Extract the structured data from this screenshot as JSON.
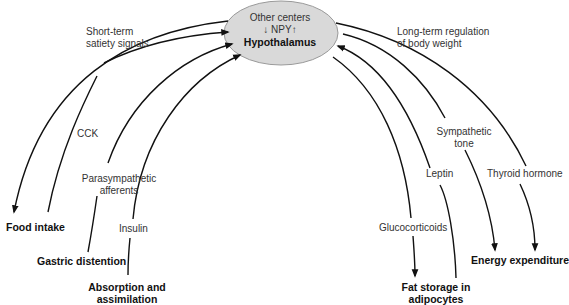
{
  "diagram": {
    "center_node": {
      "line1": "Other centers",
      "line2": "↓ NPY↑",
      "line3": "Hypothalamus",
      "fill": "#d9d9d9"
    },
    "group_labels": {
      "left": {
        "line1": "Short-term",
        "line2": "satiety signals"
      },
      "right": {
        "line1": "Long-term regulation",
        "line2": "of body weight"
      }
    },
    "signals": [
      {
        "label": "CCK",
        "direction": "to-hypothalamus"
      },
      {
        "label_line1": "Parasympathetic",
        "label_line2": "afferents",
        "direction": "to-hypothalamus"
      },
      {
        "label": "Insulin",
        "direction": "to-hypothalamus"
      },
      {
        "label": "Glucocorticoids",
        "direction": "from-hypothalamus"
      },
      {
        "label": "Leptin",
        "direction": "to-hypothalamus"
      },
      {
        "label_line1": "Sympathetic",
        "label_line2": "tone",
        "direction": "from-hypothalamus"
      },
      {
        "label": "Thyroid hormone",
        "direction": "from-hypothalamus"
      }
    ],
    "endpoints": {
      "food_intake": "Food intake",
      "gastric_distention": "Gastric distention",
      "absorption": {
        "line1": "Absorption and",
        "line2": "assimilation"
      },
      "fat_storage": {
        "line1": "Fat storage in",
        "line2": "adipocytes"
      },
      "energy_expenditure": "Energy expenditure"
    },
    "colors": {
      "line": "#111111",
      "ellipse_fill": "#d9d9d9",
      "ellipse_stroke": "#9a9a9a"
    }
  }
}
